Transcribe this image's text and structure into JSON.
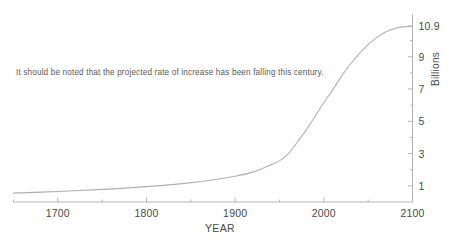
{
  "chart_data": {
    "type": "line",
    "title": "",
    "xlabel": "YEAR",
    "ylabel": "Billions",
    "xlim": [
      1650,
      2100
    ],
    "ylim": [
      0,
      11.4
    ],
    "grid": false,
    "legend": "none",
    "line_color": "#b0b0b0",
    "axis_color": "#b5b5b5",
    "text_color": "#4a4a4a",
    "annotations": [
      {
        "text": "It should be noted that the projected rate of increase has been falling this century.",
        "x": 1700,
        "y": 6.2
      }
    ],
    "x_ticks_major": [
      1700,
      1800,
      1900,
      2000,
      2100
    ],
    "x_tick_labels": [
      "1700",
      "1800",
      "1900",
      "2000",
      "2100"
    ],
    "x_ticks_minor": [
      1650,
      1750,
      1850,
      1950,
      2050
    ],
    "y_ticks_major": [
      1,
      3,
      5,
      7,
      9,
      10.9
    ],
    "y_tick_labels": [
      "1",
      "3",
      "5",
      "7",
      "9",
      "10.9"
    ],
    "y_ticks_minor": [
      2,
      4,
      6,
      8,
      10
    ],
    "x": [
      1650,
      1700,
      1750,
      1800,
      1850,
      1900,
      1920,
      1940,
      1950,
      1960,
      1970,
      1980,
      1990,
      2000,
      2010,
      2020,
      2030,
      2040,
      2050,
      2060,
      2070,
      2080,
      2090,
      2100
    ],
    "values": [
      0.55,
      0.65,
      0.78,
      0.95,
      1.2,
      1.6,
      1.85,
      2.3,
      2.55,
      3.0,
      3.7,
      4.45,
      5.3,
      6.15,
      6.95,
      7.8,
      8.55,
      9.2,
      9.75,
      10.2,
      10.55,
      10.75,
      10.85,
      10.9
    ],
    "series": [
      {
        "name": "World population",
        "values": [
          0.55,
          0.65,
          0.78,
          0.95,
          1.2,
          1.6,
          1.85,
          2.3,
          2.55,
          3.0,
          3.7,
          4.45,
          5.3,
          6.15,
          6.95,
          7.8,
          8.55,
          9.2,
          9.75,
          10.2,
          10.55,
          10.75,
          10.85,
          10.9
        ]
      }
    ]
  },
  "axis": {
    "x_title": "YEAR",
    "y_title": "Billions"
  },
  "annotation": {
    "note": "It should be noted that the projected rate of increase has been falling this century."
  }
}
